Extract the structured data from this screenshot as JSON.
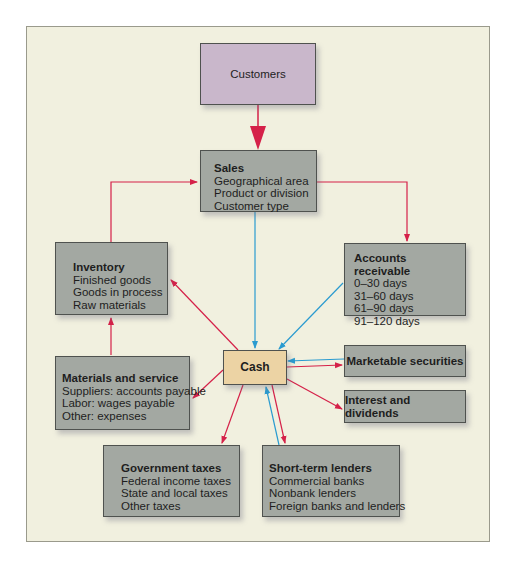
{
  "diagram": {
    "colors": {
      "background": "#f1f0df",
      "box_gray": "#a3a8a2",
      "customers_box": "#c9b7cb",
      "cash_box": "#ecd3a4",
      "red_arrow": "#d52149",
      "blue_arrow": "#2a9bd0"
    },
    "nodes": {
      "customers": {
        "label": "Customers"
      },
      "sales": {
        "title": "Sales",
        "lines": [
          "Geographical area",
          "Product or division",
          "Customer type"
        ]
      },
      "inventory": {
        "title": "Inventory",
        "lines": [
          "Finished goods",
          "Goods in process",
          "Raw materials"
        ]
      },
      "accounts_receivable": {
        "title": "Accounts receivable",
        "lines": [
          "0–30 days",
          "31–60 days",
          "61–90 days",
          "91–120 days"
        ]
      },
      "materials_service": {
        "title": "Materials and service",
        "lines": [
          "Suppliers: accounts payable",
          "Labor: wages payable",
          "Other: expenses"
        ]
      },
      "cash": {
        "label": "Cash"
      },
      "marketable_securities": {
        "label": "Marketable securities"
      },
      "interest_dividends": {
        "label": "Interest and dividends"
      },
      "government_taxes": {
        "title": "Government taxes",
        "lines": [
          "Federal income taxes",
          "State and local taxes",
          "Other taxes"
        ]
      },
      "short_term_lenders": {
        "title": "Short-term lenders",
        "lines": [
          "Commercial banks",
          "Nonbank lenders",
          "Foreign banks and lenders"
        ]
      }
    },
    "edges": [
      {
        "from": "customers",
        "to": "sales",
        "color": "red"
      },
      {
        "from": "inventory",
        "to": "sales",
        "color": "red"
      },
      {
        "from": "sales",
        "to": "accounts_receivable",
        "color": "red"
      },
      {
        "from": "sales",
        "to": "cash",
        "color": "blue"
      },
      {
        "from": "accounts_receivable",
        "to": "cash",
        "color": "blue"
      },
      {
        "from": "cash",
        "to": "inventory",
        "color": "red"
      },
      {
        "from": "materials_service",
        "to": "inventory",
        "color": "red"
      },
      {
        "from": "cash",
        "to": "materials_service",
        "color": "red"
      },
      {
        "from": "marketable_securities",
        "to": "cash",
        "color": "blue"
      },
      {
        "from": "cash",
        "to": "marketable_securities",
        "color": "red"
      },
      {
        "from": "cash",
        "to": "interest_dividends",
        "color": "red"
      },
      {
        "from": "cash",
        "to": "government_taxes",
        "color": "red"
      },
      {
        "from": "short_term_lenders",
        "to": "cash",
        "color": "blue"
      },
      {
        "from": "cash",
        "to": "short_term_lenders",
        "color": "red"
      }
    ]
  }
}
